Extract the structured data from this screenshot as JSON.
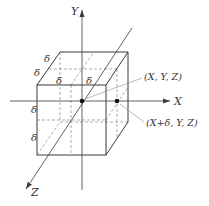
{
  "diagram": {
    "axes": {
      "x_label": "X",
      "y_label": "Y",
      "z_label": "Z"
    },
    "point_labels": {
      "center": "(X, Y, Z)",
      "offset": "(X+δ, Y, Z)"
    },
    "delta_labels": {
      "top_depth_upper": "δ",
      "top_depth_lower": "δ",
      "top_width_left": "δ",
      "top_width_right": "δ",
      "front_height_upper": "δ",
      "front_height_lower": "δ"
    },
    "colors": {
      "line": "#3a3a3a",
      "dashed": "#8a8a8a",
      "leader": "#9a9a9a",
      "dot": "#111111"
    }
  }
}
